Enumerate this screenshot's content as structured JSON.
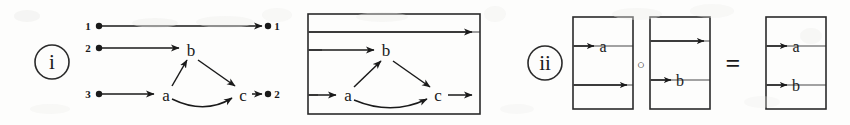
{
  "figure": {
    "background_color": "#fdfdfc",
    "ink_color": "#1a1a1a",
    "smudge_color": "#eeeeec",
    "width": 850,
    "height": 125
  },
  "parts": [
    {
      "key": "part-i",
      "label": "i",
      "label_center": [
        52,
        62
      ],
      "label_rx": 17,
      "label_ry": 17
    },
    {
      "key": "part-ii",
      "label": "ii",
      "label_center": [
        545,
        63
      ],
      "label_rx": 17,
      "label_ry": 17
    }
  ],
  "part_i": {
    "open_diagram": {
      "left_ports": [
        {
          "label": "1",
          "label_pos": [
            88,
            30
          ],
          "dot": [
            99,
            26
          ]
        },
        {
          "label": "2",
          "label_pos": [
            88,
            52
          ],
          "dot": [
            99,
            48
          ]
        },
        {
          "label": "3",
          "label_pos": [
            88,
            98
          ],
          "dot": [
            99,
            94
          ]
        }
      ],
      "right_ports": [
        {
          "label": "1",
          "label_pos": [
            277,
            30
          ],
          "dot": [
            268,
            26
          ]
        },
        {
          "label": "2",
          "label_pos": [
            277,
            98
          ],
          "dot": [
            268,
            94
          ]
        }
      ],
      "nodes": [
        {
          "label": "a",
          "pos": [
            166,
            95
          ]
        },
        {
          "label": "b",
          "pos": [
            191,
            50
          ]
        },
        {
          "label": "c",
          "pos": [
            243,
            95
          ]
        }
      ],
      "edges": [
        {
          "from": "port-1-left",
          "to": "port-1-right",
          "kind": "straight"
        },
        {
          "from": "port-2-left",
          "to": "b",
          "kind": "straight"
        },
        {
          "from": "port-3-left",
          "to": "a",
          "kind": "straight"
        },
        {
          "from": "a",
          "to": "b",
          "kind": "straight-diagonal"
        },
        {
          "from": "b",
          "to": "c",
          "kind": "straight-diagonal"
        },
        {
          "from": "a",
          "to": "c",
          "kind": "curved-arc"
        },
        {
          "from": "c",
          "to": "port-2-right",
          "kind": "straight"
        }
      ]
    },
    "boxed_diagram": {
      "box": {
        "x": 308,
        "y": 14,
        "width": 172,
        "height": 100
      },
      "dividers_y": [
        32,
        50,
        95
      ],
      "nodes": [
        {
          "label": "a",
          "pos": [
            348,
            95
          ]
        },
        {
          "label": "b",
          "pos": [
            386,
            50
          ]
        },
        {
          "label": "c",
          "pos": [
            438,
            95
          ]
        }
      ],
      "edges": [
        {
          "from": "left-boundary",
          "to": "right-boundary",
          "kind": "straight",
          "y": 32
        },
        {
          "from": "left-boundary",
          "to": "b",
          "kind": "straight",
          "y": 50
        },
        {
          "from": "left-boundary",
          "to": "a",
          "kind": "straight",
          "y": 95
        },
        {
          "from": "a",
          "to": "b",
          "kind": "straight-diagonal"
        },
        {
          "from": "b",
          "to": "c",
          "kind": "straight-diagonal"
        },
        {
          "from": "a",
          "to": "c",
          "kind": "curved-arc"
        },
        {
          "from": "c",
          "to": "right-boundary",
          "kind": "straight",
          "y": 95
        }
      ]
    }
  },
  "part_ii": {
    "operators": [
      {
        "key": "compose",
        "symbol": "○",
        "pos": [
          641,
          64
        ]
      },
      {
        "key": "equals",
        "symbol": "=",
        "pos": [
          733,
          63
        ]
      }
    ],
    "boxes": [
      {
        "key": "box-a",
        "x": 573,
        "y": 17,
        "width": 60,
        "height": 92,
        "dividers_y": [
          46,
          85
        ],
        "wires": [
          {
            "label": "a",
            "y": 46,
            "arrow": true,
            "label_pos": [
              603,
              46
            ]
          },
          {
            "label": "",
            "y": 85,
            "arrow": true,
            "label_pos": null
          }
        ]
      },
      {
        "key": "box-b",
        "x": 650,
        "y": 17,
        "width": 60,
        "height": 92,
        "dividers_y": [
          41,
          80
        ],
        "wires": [
          {
            "label": "",
            "y": 41,
            "arrow": true,
            "label_pos": null
          },
          {
            "label": "b",
            "y": 80,
            "arrow": true,
            "label_pos": [
              680,
              80
            ]
          }
        ]
      },
      {
        "key": "box-ab",
        "x": 766,
        "y": 17,
        "width": 60,
        "height": 92,
        "dividers_y": [
          46,
          85
        ],
        "wires": [
          {
            "label": "a",
            "y": 46,
            "arrow": true,
            "label_pos": [
              796,
              46
            ]
          },
          {
            "label": "b",
            "y": 85,
            "arrow": true,
            "label_pos": [
              796,
              85
            ]
          }
        ]
      }
    ]
  },
  "smudges": [
    {
      "x": 14,
      "y": 10,
      "w": 26,
      "h": 12,
      "o": 0.5
    },
    {
      "x": 132,
      "y": 18,
      "w": 46,
      "h": 10,
      "o": 0.45
    },
    {
      "x": 196,
      "y": 16,
      "w": 58,
      "h": 12,
      "o": 0.4
    },
    {
      "x": 262,
      "y": 8,
      "w": 30,
      "h": 14,
      "o": 0.35
    },
    {
      "x": 356,
      "y": 12,
      "w": 52,
      "h": 10,
      "o": 0.4
    },
    {
      "x": 484,
      "y": 6,
      "w": 22,
      "h": 16,
      "o": 0.35
    },
    {
      "x": 612,
      "y": 8,
      "w": 50,
      "h": 12,
      "o": 0.4
    },
    {
      "x": 690,
      "y": 4,
      "w": 44,
      "h": 14,
      "o": 0.35
    },
    {
      "x": 800,
      "y": 28,
      "w": 22,
      "h": 16,
      "o": 0.4
    },
    {
      "x": 30,
      "y": 104,
      "w": 40,
      "h": 10,
      "o": 0.35
    },
    {
      "x": 500,
      "y": 104,
      "w": 34,
      "h": 10,
      "o": 0.3
    },
    {
      "x": 744,
      "y": 96,
      "w": 36,
      "h": 12,
      "o": 0.3
    }
  ]
}
